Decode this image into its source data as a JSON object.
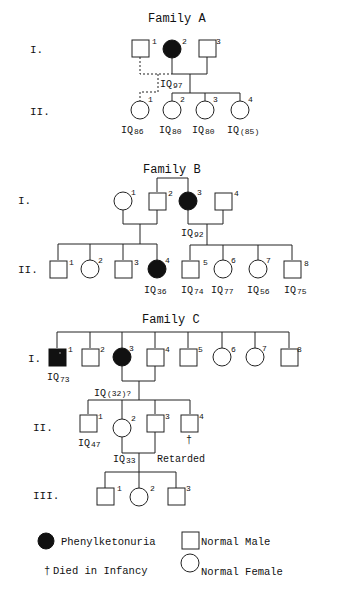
{
  "families": [
    {
      "title": "Family A",
      "generations": [
        "I.",
        "II."
      ],
      "members": [
        {
          "id": "A-I-1",
          "gen": "I",
          "num": "1",
          "sex": "male",
          "affected": false
        },
        {
          "id": "A-I-2",
          "gen": "I",
          "num": "2",
          "sex": "female",
          "affected": true,
          "iq": "97"
        },
        {
          "id": "A-I-3",
          "gen": "I",
          "num": "3",
          "sex": "male",
          "affected": false
        },
        {
          "id": "A-II-1",
          "gen": "II",
          "num": "1",
          "sex": "female",
          "affected": false,
          "iq": "86",
          "parentage": "dashed (I.1 x I.2)"
        },
        {
          "id": "A-II-2",
          "gen": "II",
          "num": "2",
          "sex": "female",
          "affected": false,
          "iq": "80"
        },
        {
          "id": "A-II-3",
          "gen": "II",
          "num": "3",
          "sex": "female",
          "affected": false,
          "iq": "80"
        },
        {
          "id": "A-II-4",
          "gen": "II",
          "num": "4",
          "sex": "female",
          "affected": false,
          "iq": "(85)"
        }
      ]
    },
    {
      "title": "Family B",
      "generations": [
        "I.",
        "II."
      ],
      "members": [
        {
          "id": "B-I-1",
          "gen": "I",
          "num": "1",
          "sex": "female",
          "affected": false
        },
        {
          "id": "B-I-2",
          "gen": "I",
          "num": "2",
          "sex": "male",
          "affected": false
        },
        {
          "id": "B-I-3",
          "gen": "I",
          "num": "3",
          "sex": "female",
          "affected": true,
          "iq": "92"
        },
        {
          "id": "B-I-4",
          "gen": "I",
          "num": "4",
          "sex": "male",
          "affected": false
        },
        {
          "id": "B-II-1",
          "gen": "II",
          "num": "1",
          "sex": "male",
          "affected": false
        },
        {
          "id": "B-II-2",
          "gen": "II",
          "num": "2",
          "sex": "female",
          "affected": false
        },
        {
          "id": "B-II-3",
          "gen": "II",
          "num": "3",
          "sex": "male",
          "affected": false
        },
        {
          "id": "B-II-4",
          "gen": "II",
          "num": "4",
          "sex": "female",
          "affected": true,
          "iq": "36"
        },
        {
          "id": "B-II-5",
          "gen": "II",
          "num": "5",
          "sex": "male",
          "affected": false,
          "iq": "74"
        },
        {
          "id": "B-II-6",
          "gen": "II",
          "num": "6",
          "sex": "female",
          "affected": false,
          "iq": "77"
        },
        {
          "id": "B-II-7",
          "gen": "II",
          "num": "7",
          "sex": "female",
          "affected": false,
          "iq": "56"
        },
        {
          "id": "B-II-8",
          "gen": "II",
          "num": "8",
          "sex": "male",
          "affected": false,
          "iq": "75"
        }
      ]
    },
    {
      "title": "Family C",
      "generations": [
        "I.",
        "II.",
        "III."
      ],
      "members": [
        {
          "id": "C-I-1",
          "gen": "I",
          "num": "1",
          "sex": "male",
          "affected": true,
          "iq": "73"
        },
        {
          "id": "C-I-2",
          "gen": "I",
          "num": "2",
          "sex": "male",
          "affected": false
        },
        {
          "id": "C-I-3",
          "gen": "I",
          "num": "3",
          "sex": "female",
          "affected": true,
          "iq": "(32)?"
        },
        {
          "id": "C-I-4",
          "gen": "I",
          "num": "4",
          "sex": "male",
          "affected": false
        },
        {
          "id": "C-I-5",
          "gen": "I",
          "num": "5",
          "sex": "male",
          "affected": false
        },
        {
          "id": "C-I-6",
          "gen": "I",
          "num": "6",
          "sex": "female",
          "affected": false
        },
        {
          "id": "C-I-7",
          "gen": "I",
          "num": "7",
          "sex": "female",
          "affected": false
        },
        {
          "id": "C-I-8",
          "gen": "I",
          "num": "8",
          "sex": "male",
          "affected": false
        },
        {
          "id": "C-II-1",
          "gen": "II",
          "num": "1",
          "sex": "male",
          "affected": false,
          "iq": "47"
        },
        {
          "id": "C-II-2",
          "gen": "II",
          "num": "2",
          "sex": "female",
          "affected": false,
          "iq": "33"
        },
        {
          "id": "C-II-3",
          "gen": "II",
          "num": "3",
          "sex": "male",
          "affected": false,
          "note": "Retarded"
        },
        {
          "id": "C-II-4",
          "gen": "II",
          "num": "4",
          "sex": "male",
          "affected": false,
          "note": "died in infancy"
        },
        {
          "id": "C-III-1",
          "gen": "III",
          "num": "1",
          "sex": "male",
          "affected": false
        },
        {
          "id": "C-III-2",
          "gen": "III",
          "num": "2",
          "sex": "female",
          "affected": false
        },
        {
          "id": "C-III-3",
          "gen": "III",
          "num": "3",
          "sex": "male",
          "affected": false
        }
      ]
    }
  ],
  "labels": {
    "iq_prefix": "IQ",
    "dagger": "†",
    "retarded": "Retarded"
  },
  "legend": {
    "affected": "Phenylketonuria",
    "male": "Normal Male",
    "died": "Died in Infancy",
    "female": "Normal Female"
  }
}
